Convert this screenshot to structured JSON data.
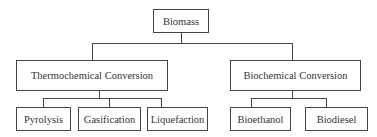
{
  "diagram": {
    "root": {
      "label": "Biomass"
    },
    "categories": [
      {
        "label": "Thermochemical Conversion",
        "children": [
          {
            "label": "Pyrolysis"
          },
          {
            "label": "Gasification"
          },
          {
            "label": "Liquefaction"
          }
        ]
      },
      {
        "label": "Biochemical Conversion",
        "children": [
          {
            "label": "Bioethanol"
          },
          {
            "label": "Biodiesel"
          }
        ]
      }
    ]
  }
}
